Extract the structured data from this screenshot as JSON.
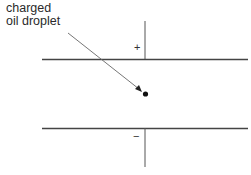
{
  "diagram": {
    "label": {
      "line1": "charged",
      "line2": "oil droplet"
    },
    "plates": {
      "top_sign": "+",
      "bottom_sign": "−"
    },
    "colors": {
      "line": "#555555",
      "droplet": "#111111",
      "text": "#2a2a2a"
    }
  }
}
